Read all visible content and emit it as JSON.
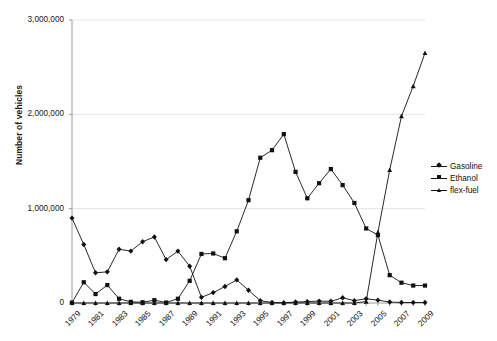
{
  "chart_data": {
    "type": "line",
    "title": "",
    "xlabel": "",
    "ylabel": "Number of vehicles",
    "ylim": [
      0,
      3000000
    ],
    "yticks": [
      0,
      1000000,
      2000000,
      3000000
    ],
    "ytick_labels": [
      "0",
      "1,000,000",
      "2,000,000",
      "3,000,000"
    ],
    "x": [
      1979,
      1980,
      1981,
      1982,
      1983,
      1984,
      1985,
      1986,
      1987,
      1988,
      1989,
      1990,
      1991,
      1992,
      1993,
      1994,
      1995,
      1996,
      1997,
      1998,
      1999,
      2000,
      2001,
      2002,
      2003,
      2004,
      2005,
      2006,
      2007,
      2008,
      2009
    ],
    "xtick_labels": [
      "1979",
      "1981",
      "1983",
      "1985",
      "1987",
      "1989",
      "1991",
      "1993",
      "1995",
      "1997",
      "1999",
      "2001",
      "2003",
      "2005",
      "2007",
      "2009"
    ],
    "xtick_step": 2,
    "grid": "horizontal",
    "legend_position": "right",
    "series": [
      {
        "name": "Gasoline",
        "marker": "diamond",
        "values": [
          900000,
          620000,
          320000,
          330000,
          570000,
          550000,
          650000,
          700000,
          460000,
          550000,
          390000,
          60000,
          110000,
          175000,
          245000,
          135000,
          25000,
          5000,
          3000,
          10000,
          15000,
          20000,
          18000,
          55000,
          25000,
          45000,
          30000,
          10000,
          5000,
          5000,
          5000
        ]
      },
      {
        "name": "Ethanol",
        "marker": "square",
        "values": [
          4000,
          220000,
          95000,
          190000,
          45000,
          12000,
          8000,
          30000,
          5000,
          45000,
          235000,
          520000,
          525000,
          475000,
          760000,
          1090000,
          1540000,
          1620000,
          1790000,
          1390000,
          1110000,
          1270000,
          1420000,
          1250000,
          1060000,
          790000,
          720000,
          295000,
          215000,
          185000,
          185000
        ]
      },
      {
        "name": "flex-fuel",
        "marker": "triangle",
        "values": [
          0,
          0,
          0,
          0,
          0,
          0,
          0,
          0,
          0,
          0,
          0,
          0,
          0,
          0,
          0,
          0,
          0,
          0,
          0,
          0,
          0,
          0,
          0,
          0,
          0,
          15000,
          750000,
          1410000,
          1980000,
          2300000,
          2650000
        ]
      }
    ],
    "legend": [
      {
        "label": "Gasoline",
        "marker": "diamond"
      },
      {
        "label": "Ethanol",
        "marker": "square"
      },
      {
        "label": "flex-fuel",
        "marker": "triangle"
      }
    ],
    "colors": {
      "series_line": "#111111",
      "grid": "#e4e4e4",
      "axis": "#9a9a9a",
      "text": "#161616"
    }
  }
}
